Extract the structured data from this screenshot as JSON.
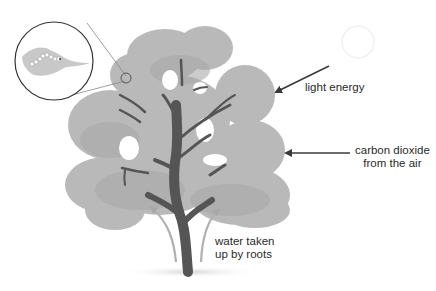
{
  "diagram": {
    "type": "photosynthesis-tree-illustration",
    "labels": {
      "light": "light energy",
      "co2_line1": "carbon dioxide",
      "co2_line2": "from the air",
      "water_line1": "water taken",
      "water_line2": "up by roots"
    },
    "inset": {
      "shape": "circle",
      "content": "magnified leaf with chloroplasts"
    },
    "colors": {
      "canopy": "#b7b7b7",
      "canopy_dark": "#a6a6a6",
      "trunk": "#555555",
      "arrow": "#3a3a3a",
      "water_arrow": "#b0b0b0",
      "text": "#2a2a2a",
      "shadow": "#e4e4e4"
    }
  }
}
